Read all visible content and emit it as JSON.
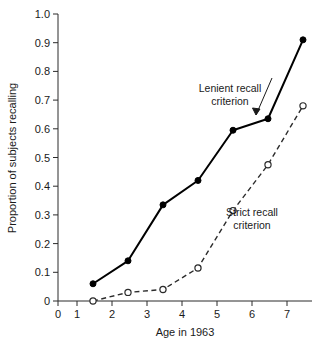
{
  "chart_data": {
    "type": "line",
    "title": "",
    "xlabel": "Age in 1963",
    "ylabel": "Proportion of subjects recalling",
    "x": [
      1,
      2,
      3,
      4,
      5,
      6,
      7
    ],
    "xlim": [
      0,
      7.6
    ],
    "ylim": [
      0,
      1.0
    ],
    "grid": false,
    "legend_position": "inline-annotation",
    "xticks": [
      "0",
      "1",
      "2",
      "3",
      "4",
      "5",
      "6",
      "7"
    ],
    "xtick_values": [
      0,
      1,
      2,
      3,
      4,
      5,
      6,
      7
    ],
    "yticks": [
      "0",
      "0.1",
      "0.2",
      "0.3",
      "0.4",
      "0.5",
      "0.6",
      "0.7",
      "0.8",
      "0.9",
      "1.0"
    ],
    "ytick_values": [
      0,
      0.1,
      0.2,
      0.3,
      0.4,
      0.5,
      0.6,
      0.7,
      0.8,
      0.9,
      1.0
    ],
    "series": [
      {
        "name": "Lenient recall criterion",
        "marker": "filled-circle",
        "linestyle": "solid",
        "color": "#000000",
        "values": [
          0.06,
          0.14,
          0.335,
          0.42,
          0.595,
          0.635,
          0.91
        ]
      },
      {
        "name": "Strict recall criterion",
        "marker": "open-circle",
        "linestyle": "dashed",
        "color": "#2b2b2b",
        "values": [
          0.0,
          0.03,
          0.04,
          0.115,
          0.315,
          0.475,
          0.68
        ]
      }
    ],
    "annotations": [
      {
        "text_line1": "Lenient recall",
        "text_line2": "criterion"
      },
      {
        "text_line1": "Strict recall",
        "text_line2": "criterion"
      }
    ]
  }
}
